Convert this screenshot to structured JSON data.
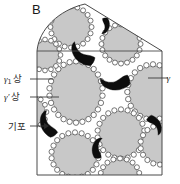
{
  "figure": {
    "panel_label": "B",
    "type": "microstructure-schematic",
    "background_color": "#ffffff",
    "frame_color": "#4a4a4a",
    "matrix_fill": "#ffffff"
  },
  "annotations": [
    {
      "id": "gamma1-phase",
      "name": "gamma-one-phase-label",
      "symbol": "γ",
      "subscript": "1",
      "text": "상",
      "full_text": "γ₁상",
      "x": 4,
      "y": 82,
      "leader_from_x": 30,
      "leader_from_y": 79,
      "leader_to_x": 53,
      "leader_to_y": 79
    },
    {
      "id": "gamma-prime-phase",
      "name": "gamma-prime-phase-label",
      "symbol": "γ",
      "prime": "′",
      "text": "상",
      "full_text": "γ′상",
      "x": 4,
      "y": 100,
      "leader_from_x": 30,
      "leader_from_y": 97,
      "leader_to_x": 59,
      "leader_to_y": 97
    },
    {
      "id": "pore",
      "name": "pore-label",
      "text": "기포",
      "full_text": "기포",
      "x": 7,
      "y": 130,
      "leader_from_x": 30,
      "leader_from_y": 126,
      "leader_to_x": 44,
      "leader_to_y": 126,
      "arrow": true
    },
    {
      "id": "gamma-phase-right",
      "name": "gamma-phase-label-right",
      "symbol": "γ",
      "full_text": "γ",
      "x": 170,
      "y": 81,
      "leader_from_x": 168,
      "leader_from_y": 78,
      "leader_to_x": 148,
      "leader_to_y": 78
    }
  ],
  "legend_keys": {
    "gamma1": "γ₁ 상 (matrix phase)",
    "gamma_prime": "γ′ 상 (precipitate phase)",
    "pore": "기포 (pore / bubble)",
    "gamma": "γ (gamma phase)"
  },
  "geometry": {
    "frame": {
      "left": 37,
      "right": 162,
      "top_line_y": 51,
      "bottom": 175,
      "apex_x": 85,
      "apex_y": 4,
      "diagonal_end_x": 162,
      "diagonal_end_y": 51
    },
    "grain_color": "#c8c8c8",
    "grain_stroke": "#8a8a8a",
    "precipitate_fill": "#ffffff",
    "precipitate_stroke": "#4a4a4a",
    "pore_fill": "#0d0d0d"
  },
  "grains": [
    {
      "cx": 76,
      "cy": 92,
      "rx": 25,
      "ry": 29,
      "beads": 26,
      "bead_r": 2.7
    },
    {
      "cx": 153,
      "cy": 92,
      "rx": 24,
      "ry": 26,
      "beads": 24,
      "bead_r": 2.7
    },
    {
      "cx": 121,
      "cy": 134,
      "rx": 22,
      "ry": 23,
      "beads": 22,
      "bead_r": 2.6
    },
    {
      "cx": 75,
      "cy": 155,
      "rx": 22,
      "ry": 21,
      "beads": 22,
      "bead_r": 2.6
    },
    {
      "cx": 71,
      "cy": 27,
      "rx": 19,
      "ry": 19,
      "beads": 20,
      "bead_r": 2.5
    },
    {
      "cx": 121,
      "cy": 44,
      "rx": 18,
      "ry": 18,
      "beads": 20,
      "bead_r": 2.5
    },
    {
      "cx": 45,
      "cy": 55,
      "rx": 14,
      "ry": 14,
      "beads": 16,
      "bead_r": 2.4
    },
    {
      "cx": 160,
      "cy": 145,
      "rx": 18,
      "ry": 18,
      "beads": 18,
      "bead_r": 2.6
    },
    {
      "cx": 120,
      "cy": 176,
      "rx": 18,
      "ry": 16,
      "beads": 18,
      "bead_r": 2.5
    },
    {
      "cx": 35,
      "cy": 112,
      "rx": 10,
      "ry": 13,
      "beads": 12,
      "bead_r": 2.4
    }
  ],
  "pores": [
    {
      "id": "pore-top-right",
      "cx": 105,
      "cy": 26,
      "scale": 0.55,
      "rot": 20
    },
    {
      "id": "pore-mid-upper",
      "cx": 82,
      "cy": 54,
      "scale": 0.95,
      "rot": 145
    },
    {
      "id": "pore-center",
      "cx": 115,
      "cy": 82,
      "scale": 1.0,
      "rot": 100
    },
    {
      "id": "pore-left-mid",
      "cx": 48,
      "cy": 124,
      "scale": 0.9,
      "rot": 170
    },
    {
      "id": "pore-right-mid",
      "cx": 155,
      "cy": 125,
      "scale": 0.7,
      "rot": -20
    },
    {
      "id": "pore-lower-center",
      "cx": 98,
      "cy": 148,
      "scale": 0.7,
      "rot": 200
    }
  ]
}
